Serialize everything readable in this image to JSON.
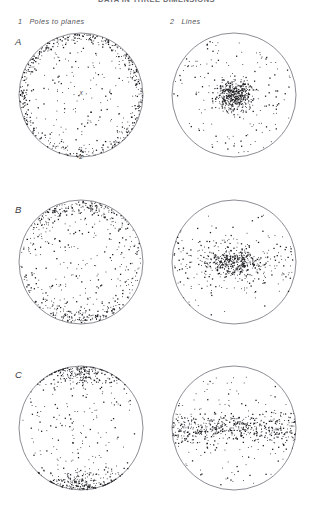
{
  "figure": {
    "clipped_title": "DATA IN THREE DIMENSIONS",
    "columns": [
      {
        "num": "1",
        "label": "Poles to planes"
      },
      {
        "num": "2",
        "label": "Lines"
      }
    ],
    "rows": [
      {
        "label": "A"
      },
      {
        "label": "B"
      },
      {
        "label": "C"
      }
    ],
    "axis_letters": {
      "center": "X",
      "bottom": "Z",
      "right": "Y"
    },
    "colors": {
      "circle_stroke": "#5a5a66",
      "point": "#1d1d22",
      "text": "#3a3a3f",
      "background": "#ffffff"
    }
  },
  "chart_data": [
    {
      "id": "A1",
      "type": "scatter",
      "title": "A1",
      "projection": "stereonet-equal-area",
      "row": "A",
      "column": "1 Poles to planes",
      "distribution": "peripheral-ring",
      "n_points": 620,
      "center": [
        81,
        95
      ],
      "radius": 62,
      "density_profile": {
        "edge_weight": 0.82,
        "core_weight": 0.18
      },
      "annotations": [
        "X",
        "Y",
        "Z"
      ],
      "xlabel": "",
      "ylabel": "",
      "grid": false,
      "legend": false
    },
    {
      "id": "A2",
      "type": "scatter",
      "title": "A2",
      "projection": "stereonet-equal-area",
      "row": "A",
      "column": "2 Lines",
      "distribution": "central-cluster",
      "n_points": 620,
      "center": [
        234,
        95
      ],
      "radius": 62,
      "density_profile": {
        "cluster_sigma": 0.14,
        "cluster_frac": 0.72,
        "background_frac": 0.28
      },
      "annotations": [],
      "xlabel": "",
      "ylabel": "",
      "grid": false,
      "legend": false
    },
    {
      "id": "B1",
      "type": "scatter",
      "title": "B1",
      "projection": "stereonet-equal-area",
      "row": "B",
      "column": "1 Poles to planes",
      "distribution": "ns-girdle-periphery",
      "n_points": 600,
      "center": [
        81,
        262
      ],
      "radius": 62,
      "density_profile": {
        "edge_weight": 0.6,
        "core_weight": 0.4,
        "axis": "north-south"
      },
      "annotations": [],
      "xlabel": "",
      "ylabel": "",
      "grid": false,
      "legend": false
    },
    {
      "id": "B2",
      "type": "scatter",
      "title": "B2",
      "projection": "stereonet-equal-area",
      "row": "B",
      "column": "2 Lines",
      "distribution": "central-cluster-ew-elongated",
      "n_points": 620,
      "center": [
        234,
        262
      ],
      "radius": 62,
      "density_profile": {
        "cluster_sigma_x": 0.22,
        "cluster_sigma_y": 0.1,
        "cluster_frac": 0.6,
        "background_frac": 0.4
      },
      "annotations": [],
      "xlabel": "",
      "ylabel": "",
      "grid": false,
      "legend": false
    },
    {
      "id": "C1",
      "type": "scatter",
      "title": "C1",
      "projection": "stereonet-equal-area",
      "row": "C",
      "column": "1 Poles to planes",
      "distribution": "bipolar-ns-concentration",
      "n_points": 600,
      "center": [
        81,
        428
      ],
      "radius": 62,
      "density_profile": {
        "pole_frac": 0.74,
        "background_frac": 0.26,
        "axis": "north-south"
      },
      "annotations": [],
      "xlabel": "",
      "ylabel": "",
      "grid": false,
      "legend": false
    },
    {
      "id": "C2",
      "type": "scatter",
      "title": "C2",
      "projection": "stereonet-equal-area",
      "row": "C",
      "column": "2 Lines",
      "distribution": "ew-girdle-band",
      "n_points": 640,
      "center": [
        234,
        428
      ],
      "radius": 62,
      "density_profile": {
        "band_frac": 0.78,
        "band_half_width": 0.18,
        "background_frac": 0.22,
        "axis": "east-west"
      },
      "annotations": [],
      "xlabel": "",
      "ylabel": "",
      "grid": false,
      "legend": false
    }
  ]
}
